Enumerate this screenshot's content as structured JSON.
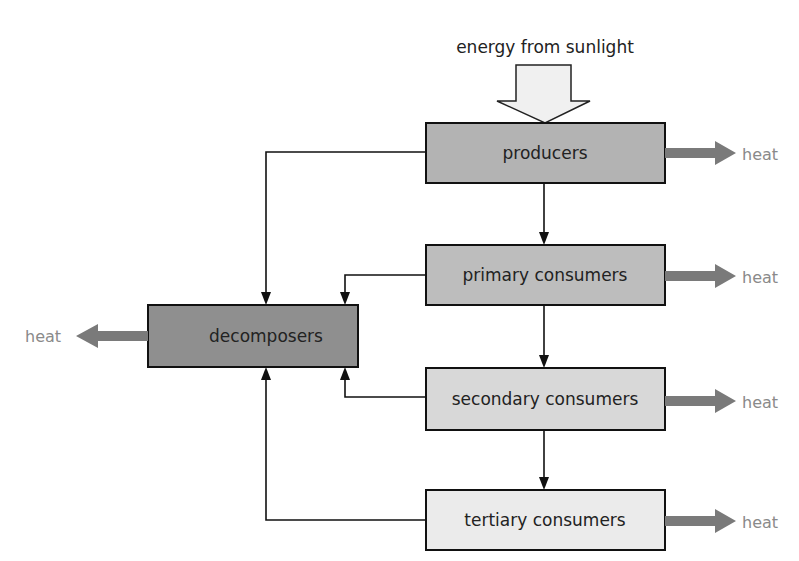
{
  "diagram": {
    "title": "energy from sunlight",
    "nodes": [
      {
        "id": "producers",
        "label": "producers",
        "color": "#b3b3b3",
        "heat_label": "heat",
        "heat_side": "right"
      },
      {
        "id": "primary",
        "label": "primary consumers",
        "color": "#bdbdbd",
        "heat_label": "heat",
        "heat_side": "right"
      },
      {
        "id": "secondary",
        "label": "secondary consumers",
        "color": "#d8d8d8",
        "heat_label": "heat",
        "heat_side": "right"
      },
      {
        "id": "tertiary",
        "label": "tertiary consumers",
        "color": "#ebebeb",
        "heat_label": "heat",
        "heat_side": "right"
      },
      {
        "id": "decomposers",
        "label": "decomposers",
        "color": "#8f8f8f",
        "heat_label": "heat",
        "heat_side": "left"
      }
    ],
    "edges": [
      {
        "from": "sunlight",
        "to": "producers"
      },
      {
        "from": "producers",
        "to": "primary"
      },
      {
        "from": "primary",
        "to": "secondary"
      },
      {
        "from": "secondary",
        "to": "tertiary"
      },
      {
        "from": "producers",
        "to": "decomposers"
      },
      {
        "from": "primary",
        "to": "decomposers"
      },
      {
        "from": "secondary",
        "to": "decomposers"
      },
      {
        "from": "tertiary",
        "to": "decomposers"
      }
    ],
    "colors": {
      "heat_arrow": "#7a7a7a",
      "heat_text": "#8a8a8a",
      "sun_arrow_fill": "#f0f0f0",
      "line": "#111111"
    }
  }
}
